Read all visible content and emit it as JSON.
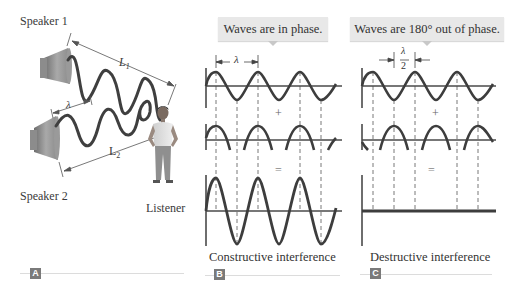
{
  "panel_a": {
    "speaker1_label": "Speaker 1",
    "speaker2_label": "Speaker 2",
    "listener_label": "Listener",
    "distance1_label": "L",
    "distance1_sub": "1",
    "distance2_label": "L",
    "distance2_sub": "2",
    "wavelength_label": "λ",
    "tag": "A"
  },
  "panel_b": {
    "callout": "Waves are in phase.",
    "wavelength_label": "λ",
    "plus": "+",
    "equals": "=",
    "caption": "Constructive interference",
    "tag": "B"
  },
  "panel_c": {
    "callout": "Waves are 180° out of phase.",
    "half_wavelength_numerator": "λ",
    "half_wavelength_denominator": "2",
    "plus": "+",
    "equals": "=",
    "caption": "Destructive interference",
    "tag": "C"
  },
  "colors": {
    "wave": "#3d3d3d",
    "axis": "#4a4a4a",
    "callout_bg": "#e8e8e8",
    "tag_bg": "#7a7a7a",
    "rule": "#dcdcdc"
  }
}
